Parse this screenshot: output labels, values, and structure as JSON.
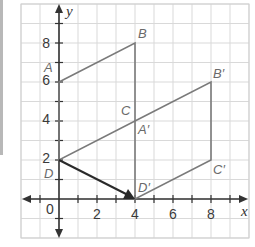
{
  "diagram": {
    "type": "coordinate-plane-transformation",
    "axes": {
      "x_label": "x",
      "y_label": "y",
      "x_range": [
        -2,
        10
      ],
      "y_range": [
        -2,
        10
      ],
      "origin_label": "0",
      "x_ticks": [
        "2",
        "4",
        "6",
        "8"
      ],
      "y_ticks": [
        "2",
        "4",
        "6",
        "8"
      ]
    },
    "original": {
      "name": "ABCD",
      "vertices": {
        "A": [
          0,
          6
        ],
        "B": [
          4,
          8
        ],
        "C": [
          4,
          4
        ],
        "D": [
          0,
          2
        ]
      },
      "labels": {
        "A": "A",
        "B": "B",
        "C": "C",
        "D": "D"
      }
    },
    "image": {
      "name": "A'B'C'D'",
      "vertices": {
        "A'": [
          4,
          4
        ],
        "B'": [
          8,
          6
        ],
        "C'": [
          8,
          2
        ],
        "D'": [
          4,
          0
        ]
      },
      "labels": {
        "A'": "A′",
        "B'": "B′",
        "C'": "C′",
        "D'": "D′"
      }
    },
    "translation_vector": {
      "from": [
        0,
        2
      ],
      "to": [
        4,
        0
      ]
    },
    "colors": {
      "grid": "#d9d9d9",
      "axes": "#333333",
      "figure": "#7a7a7a",
      "vector": "#2a2a2a"
    }
  }
}
